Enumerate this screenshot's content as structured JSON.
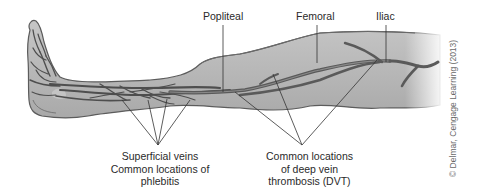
{
  "figure": {
    "labels": {
      "popliteal": "Popliteal",
      "femoral": "Femoral",
      "iliac": "Iliac",
      "superficial_line1": "Superficial veins",
      "superficial_line2": "Common locations of",
      "superficial_line3": "phlebitis",
      "dvt_line1": "Common locations",
      "dvt_line2": "of deep vein",
      "dvt_line3": "thrombosis (DVT)"
    },
    "credit": "© Delmar, Cengage Learning (2013)",
    "colors": {
      "skin": "#b8b8b8",
      "skin_light": "#d4d4d4",
      "outline": "#5c5c5c",
      "vein": "#6a6a6a",
      "vein_dark": "#4e4e4e",
      "leader_line": "#333333",
      "text": "#2a2a2a"
    }
  }
}
